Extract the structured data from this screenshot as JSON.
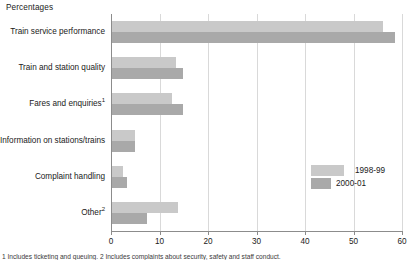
{
  "chart_data": {
    "type": "bar",
    "orientation": "horizontal",
    "title": "Percentages",
    "xlabel": "",
    "ylabel": "",
    "xlim": [
      0,
      60
    ],
    "xticks": [
      0,
      10,
      20,
      30,
      40,
      50,
      60
    ],
    "grid": true,
    "legend_position": "inside-right",
    "categories": [
      "Train service performance",
      "Train and station quality",
      "Fares and enquiries",
      "Information on stations/trains",
      "Complaint handling",
      "Other"
    ],
    "category_footnote_markers": [
      "",
      "",
      "1",
      "",
      "",
      "2"
    ],
    "series": [
      {
        "name": "1998-99",
        "color": "#c9c9c9",
        "values": [
          56.0,
          13.4,
          12.6,
          5.0,
          2.5,
          13.8
        ]
      },
      {
        "name": "2000-01",
        "color": "#a9a9a9",
        "values": [
          58.5,
          14.8,
          14.8,
          5.0,
          3.3,
          7.4
        ]
      }
    ],
    "footnote": "1 Includes ticketing and queuing. 2 Includes complaints about security, safety and staff conduct."
  },
  "axis": {
    "tick_labels": [
      "0",
      "10",
      "20",
      "30",
      "40",
      "50",
      "60"
    ]
  },
  "legend": {
    "items": [
      {
        "label": "1998-99"
      },
      {
        "label": "2000-01"
      }
    ]
  }
}
